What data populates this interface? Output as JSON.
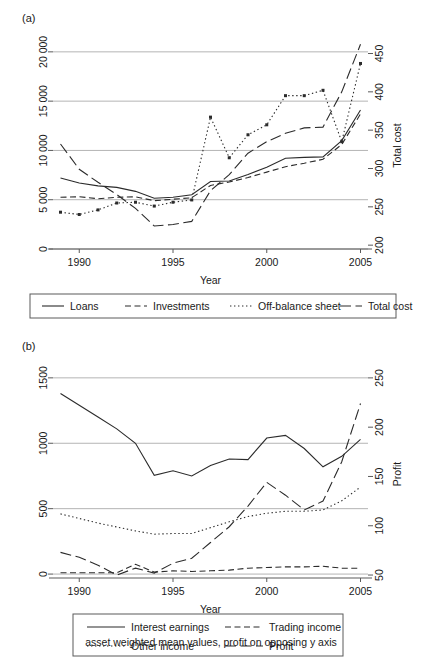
{
  "figure": {
    "caption": "asset weighted mean values, profit on opposing y axis"
  },
  "panel_a": {
    "label": "(a)",
    "xlabel": "Year",
    "y_left_ticks": [
      "0",
      "5 000",
      "10 000",
      "15 000",
      "20 000"
    ],
    "y_right_title": "Total cost",
    "y_right_ticks": [
      "200",
      "250",
      "300",
      "350",
      "400",
      "450"
    ],
    "x_ticks": [
      "1990",
      "1995",
      "2000",
      "2005"
    ],
    "legend": [
      {
        "label": "Loans",
        "dash": "none"
      },
      {
        "label": "Investments",
        "dash": "dashed"
      },
      {
        "label": "Off-balance sheet",
        "dash": "dotted"
      },
      {
        "label": "Total cost",
        "dash": "longdash"
      }
    ]
  },
  "panel_b": {
    "label": "(b)",
    "xlabel": "Year",
    "y_left_ticks": [
      "0",
      "500",
      "1000",
      "1500"
    ],
    "y_right_title": "Profit",
    "y_right_ticks": [
      "50",
      "100",
      "150",
      "200",
      "250"
    ],
    "x_ticks": [
      "1990",
      "1995",
      "2000",
      "2005"
    ],
    "legend": [
      {
        "label": "Interest earnings",
        "dash": "none"
      },
      {
        "label": "Trading income",
        "dash": "dashed"
      },
      {
        "label": "Other income",
        "dash": "dotted"
      },
      {
        "label": "Profit",
        "dash": "longdash"
      }
    ]
  },
  "chart_data": [
    {
      "id": "panel_a",
      "type": "line",
      "title": "(a)",
      "xlabel": "Year",
      "ylabel": "",
      "y2label": "Total cost",
      "xlim": [
        1988.6,
        2005.4
      ],
      "ylim": [
        0,
        21000
      ],
      "y2lim": [
        195,
        465
      ],
      "yticks": [
        0,
        5000,
        10000,
        15000,
        20000
      ],
      "y2ticks": [
        200,
        250,
        300,
        350,
        400,
        450
      ],
      "xticks": [
        1990,
        1995,
        2000,
        2005
      ],
      "grid": true,
      "legend_position": "below",
      "x": [
        1989,
        1990,
        1991,
        1992,
        1993,
        1994,
        1995,
        1996,
        1997,
        1998,
        1999,
        2000,
        2001,
        2002,
        2003,
        2004,
        2005
      ],
      "series": [
        {
          "name": "Loans",
          "axis": "left",
          "dash": "none",
          "markers": false,
          "values": [
            7200,
            6700,
            6400,
            6250,
            5850,
            5150,
            5250,
            5500,
            6850,
            6900,
            7550,
            8300,
            9200,
            9300,
            9350,
            11000,
            14100
          ]
        },
        {
          "name": "Investments",
          "axis": "left",
          "dash": "dashed",
          "markers": false,
          "values": [
            5250,
            5300,
            5100,
            5250,
            5300,
            4900,
            5050,
            5200,
            6450,
            6800,
            7250,
            7800,
            8350,
            8700,
            9100,
            10600,
            13700
          ]
        },
        {
          "name": "Off-balance sheet",
          "axis": "right",
          "dash": "dotted",
          "markers": true,
          "values": [
            243,
            240,
            246,
            255,
            256,
            251,
            256,
            259,
            367,
            314,
            344,
            357,
            395,
            395,
            402,
            335,
            437
          ]
        },
        {
          "name": "Total cost",
          "axis": "right",
          "dash": "longdash",
          "markers": false,
          "values": [
            332,
            299,
            282,
            266,
            248,
            225,
            227,
            231,
            271,
            292,
            320,
            335,
            346,
            353,
            354,
            400,
            462
          ]
        }
      ]
    },
    {
      "id": "panel_b",
      "type": "line",
      "title": "(b)",
      "xlabel": "Year",
      "ylabel": "",
      "y2label": "Profit",
      "xlim": [
        1988.6,
        2005.4
      ],
      "ylim": [
        -30,
        1560
      ],
      "y2lim": [
        47,
        258
      ],
      "yticks": [
        0,
        500,
        1000,
        1500
      ],
      "y2ticks": [
        50,
        100,
        150,
        200,
        250
      ],
      "xticks": [
        1990,
        1995,
        2000,
        2005
      ],
      "grid": true,
      "legend_position": "below",
      "x": [
        1989,
        1990,
        1991,
        1992,
        1993,
        1994,
        1995,
        1996,
        1997,
        1998,
        1999,
        2000,
        2001,
        2002,
        2003,
        2004,
        2005
      ],
      "series": [
        {
          "name": "Interest earnings",
          "axis": "left",
          "dash": "none",
          "markers": false,
          "values": [
            1380,
            1290,
            1200,
            1110,
            1000,
            755,
            790,
            750,
            830,
            880,
            875,
            1040,
            1060,
            960,
            820,
            900,
            1030
          ]
        },
        {
          "name": "Trading income",
          "axis": "left",
          "dash": "dashed",
          "markers": false,
          "values": [
            10,
            10,
            10,
            10,
            75,
            15,
            25,
            20,
            25,
            30,
            45,
            50,
            55,
            55,
            60,
            45,
            45
          ]
        },
        {
          "name": "Other income",
          "axis": "left",
          "dash": "dotted",
          "markers": false,
          "values": [
            460,
            425,
            390,
            360,
            330,
            305,
            310,
            310,
            355,
            400,
            440,
            465,
            480,
            480,
            490,
            560,
            665
          ]
        },
        {
          "name": "Profit",
          "axis": "right",
          "dash": "longdash",
          "markers": false,
          "values": [
            73,
            68,
            60,
            50,
            57,
            52,
            62,
            67,
            83,
            99,
            120,
            144,
            131,
            116,
            125,
            165,
            224
          ]
        }
      ]
    }
  ]
}
